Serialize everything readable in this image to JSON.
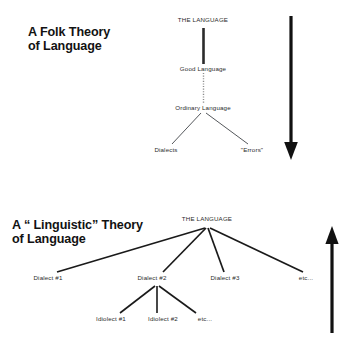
{
  "canvas": {
    "width": 343,
    "height": 339,
    "background": "#ffffff"
  },
  "diagram": {
    "ink_color": "#2b2b2b",
    "title_color": "#121212",
    "panels": [
      {
        "id": "folk-theory",
        "title_line1": "A Folk Theory",
        "title_line2": "of Language",
        "direction_arrow": "down-arrow",
        "nodes": [
          {
            "id": "the-language",
            "label": "THE LANGUAGE"
          },
          {
            "id": "good-language",
            "label": "Good Language"
          },
          {
            "id": "ordinary-language",
            "label": "Ordinary Language"
          },
          {
            "id": "dialects",
            "label": "Dialects"
          },
          {
            "id": "errors",
            "label": "\"Errors\""
          }
        ]
      },
      {
        "id": "linguistic-theory",
        "title_line1": "A “ Linguistic” Theory",
        "title_line2": "of Language",
        "direction_arrow": "up-arrow",
        "nodes": [
          {
            "id": "the-language",
            "label": "THE LANGUAGE"
          },
          {
            "id": "dialect-1",
            "label": "Dialect #1"
          },
          {
            "id": "dialect-2",
            "label": "Dialect #2"
          },
          {
            "id": "dialect-3",
            "label": "Dialect #3"
          },
          {
            "id": "dialect-etc",
            "label": "etc..."
          },
          {
            "id": "idiolect-1",
            "label": "Idiolect #1"
          },
          {
            "id": "idiolect-2",
            "label": "Idiolect #2"
          },
          {
            "id": "idiolect-etc",
            "label": "etc..."
          }
        ]
      }
    ]
  }
}
